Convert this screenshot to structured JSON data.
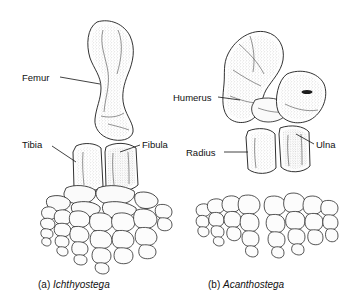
{
  "figure": {
    "background_color": "#ffffff",
    "ink_color": "#1b1b1b",
    "style": "black-and-white stippled scientific line illustration of fossil tetrapod limb skeletons"
  },
  "labels": [
    {
      "id": "femur",
      "text": "Femur",
      "x": 22,
      "y": 73,
      "align": "left",
      "leader": {
        "x1": 60,
        "y1": 77,
        "x2": 100,
        "y2": 84
      }
    },
    {
      "id": "tibia",
      "text": "Tibia",
      "x": 22,
      "y": 140,
      "align": "left",
      "leader": {
        "x1": 52,
        "y1": 146,
        "x2": 76,
        "y2": 162
      }
    },
    {
      "id": "fibula",
      "text": "Fibula",
      "x": 142,
      "y": 140,
      "align": "left",
      "leader": {
        "x1": 140,
        "y1": 145,
        "x2": 120,
        "y2": 152
      }
    },
    {
      "id": "humerus",
      "text": "Humerus",
      "x": 173,
      "y": 93,
      "align": "left",
      "leader": {
        "x1": 218,
        "y1": 97,
        "x2": 240,
        "y2": 100
      }
    },
    {
      "id": "radius",
      "text": "Radius",
      "x": 186,
      "y": 148,
      "align": "left",
      "leader": {
        "x1": 224,
        "y1": 152,
        "x2": 248,
        "y2": 152
      }
    },
    {
      "id": "ulna",
      "text": "Ulna",
      "x": 316,
      "y": 140,
      "align": "left",
      "leader": {
        "x1": 314,
        "y1": 144,
        "x2": 296,
        "y2": 134
      }
    }
  ],
  "captions": [
    {
      "id": "caption-a",
      "marker": "(a)",
      "genus": "Ichthyostega",
      "x": 38,
      "y": 280
    },
    {
      "id": "caption-b",
      "marker": "(b)",
      "genus": "Acanthostega",
      "x": 208,
      "y": 280
    }
  ],
  "specimens": [
    {
      "id": "ichthyostega",
      "label": "Ichthyostega",
      "side": "left",
      "limb": "hind limb",
      "bones": [
        "Femur",
        "Tibia",
        "Fibula",
        "tarsals",
        "digits"
      ],
      "digit_count": 7
    },
    {
      "id": "acanthostega",
      "label": "Acanthostega",
      "side": "right",
      "limb": "fore limb",
      "bones": [
        "Humerus",
        "Radius",
        "Ulna",
        "carpals",
        "digits"
      ],
      "digit_count": 8
    }
  ]
}
